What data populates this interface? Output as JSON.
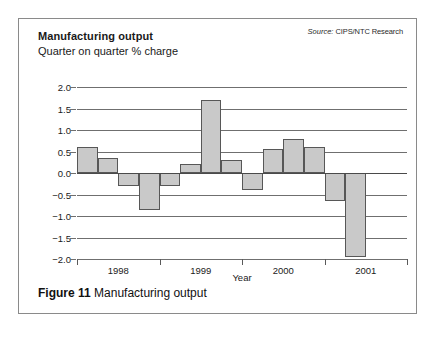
{
  "figure": {
    "caption_number": "Figure 11",
    "caption_text": "Manufacturing output"
  },
  "header": {
    "title": "Manufacturing output",
    "subtitle": "Quarter on quarter % charge",
    "source_label": "Source:",
    "source_value": "CIPS/NTC Research"
  },
  "colors": {
    "bar_fill": "#c9c9c9",
    "bar_stroke": "#575757",
    "gridline": "#6f6f6f",
    "frame": "#8a8a8a",
    "text": "#1a1a1a"
  },
  "chart_data": {
    "type": "bar",
    "title": "Manufacturing output",
    "subtitle": "Quarter on quarter % charge",
    "xlabel": "Year",
    "ylabel": "",
    "ylim": [
      -2.0,
      2.0
    ],
    "grid": true,
    "legend": "none",
    "source": "Source: CIPS/NTC Research",
    "ytick_labels": [
      "2.0",
      "1.5",
      "1.0",
      "0.5",
      "0.0",
      "−0.5",
      "−1.0",
      "−1.5",
      "−2.0"
    ],
    "ytick_values": [
      2.0,
      1.5,
      1.0,
      0.5,
      0.0,
      -0.5,
      -1.0,
      -1.5,
      -2.0
    ],
    "xtick_labels": [
      "1998",
      "1999",
      "2000",
      "2001"
    ],
    "categories": [
      "1998 Q1",
      "1998 Q2",
      "1998 Q3",
      "1998 Q4",
      "1999 Q1",
      "1999 Q2",
      "1999 Q3",
      "1999 Q4",
      "2000 Q1",
      "2000 Q2",
      "2000 Q3",
      "2000 Q4",
      "2001 Q1",
      "2001 Q2",
      "2001 Q3",
      "2001 Q4"
    ],
    "values": [
      0.6,
      0.35,
      -0.3,
      -0.85,
      -0.3,
      0.2,
      1.7,
      0.3,
      -0.4,
      0.55,
      0.8,
      0.6,
      -0.65,
      -1.95,
      null,
      null
    ]
  }
}
